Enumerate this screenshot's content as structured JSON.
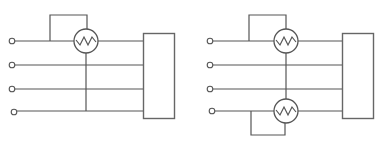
{
  "figure": {
    "type": "circuit-diagram",
    "colors": {
      "line": "#555555",
      "background": "#ffffff"
    },
    "diagrams": [
      {
        "id": "left",
        "terminals": 4,
        "wattmeters": 1,
        "wattmeter_positions": [
          "top line"
        ],
        "load_box": true
      },
      {
        "id": "right",
        "terminals": 4,
        "wattmeters": 2,
        "wattmeter_positions": [
          "top line",
          "bottom line"
        ],
        "load_box": true
      }
    ]
  }
}
